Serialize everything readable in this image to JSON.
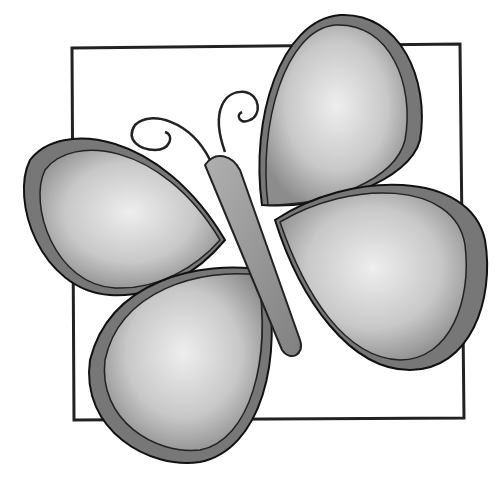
{
  "image": {
    "subject": "butterfly illustration",
    "style": "grayscale hand-drawn",
    "colors": {
      "background": "#ffffff",
      "outline": "#1a1a1a",
      "wing_light": "#e6e6e6",
      "wing_mid": "#b5b5b5",
      "wing_dark": "#7a7a7a",
      "body": "#9a9a9a",
      "frame": "#222222"
    }
  }
}
